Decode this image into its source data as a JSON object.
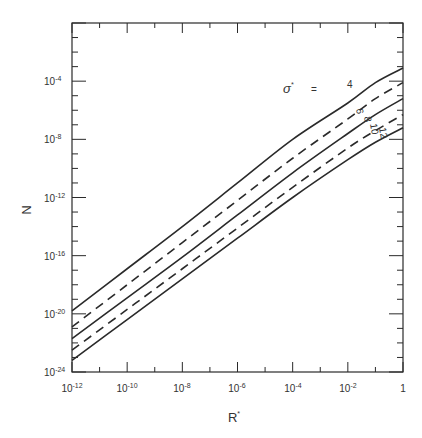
{
  "chart_data": {
    "type": "line",
    "title": "",
    "xlabel": "R*",
    "ylabel": "N",
    "xscale": "log",
    "yscale": "log",
    "xlim": [
      1e-12,
      1
    ],
    "ylim": [
      1e-24,
      1
    ],
    "grid": false,
    "legend_position": "inline labels near right end",
    "legend_title": "σ* =",
    "x_ticks": [
      "10^-12",
      "10^-10",
      "10^-8",
      "10^-6",
      "10^-4",
      "10^-2",
      "1"
    ],
    "y_ticks": [
      "10^-24",
      "10^-20",
      "10^-16",
      "10^-12",
      "10^-8",
      "10^-4"
    ],
    "x_log10": [
      -12,
      -10,
      -8,
      -6,
      -4,
      -2,
      -1,
      0
    ],
    "series": [
      {
        "name": "σ* = 4",
        "style": "solid",
        "log10_y": [
          -19.8,
          -16.9,
          -14.0,
          -11.0,
          -8.0,
          -5.5,
          -4.1,
          -3.1
        ]
      },
      {
        "name": "σ* = 6",
        "style": "dashed",
        "log10_y": [
          -20.9,
          -18.0,
          -15.1,
          -12.2,
          -9.3,
          -6.6,
          -5.2,
          -4.1
        ]
      },
      {
        "name": "σ* = 8",
        "style": "solid",
        "log10_y": [
          -21.7,
          -18.9,
          -16.1,
          -13.2,
          -10.3,
          -7.6,
          -6.3,
          -5.2
        ]
      },
      {
        "name": "σ* = 10",
        "style": "dashed",
        "log10_y": [
          -22.5,
          -19.7,
          -16.9,
          -14.1,
          -11.3,
          -8.6,
          -7.4,
          -6.3
        ]
      },
      {
        "name": "σ* = 12",
        "style": "solid",
        "log10_y": [
          -23.2,
          -20.4,
          -17.6,
          -14.8,
          -12.0,
          -9.4,
          -8.2,
          -7.2
        ]
      }
    ]
  },
  "labels": {
    "xlabel": "R",
    "xlabel_sup": "*",
    "ylabel": "N",
    "legend_sigma": "σ",
    "legend_sup": "*",
    "legend_eq": "=",
    "curve_labels": [
      "4",
      "6",
      "8",
      "10",
      "12"
    ],
    "x_tick_base": [
      "10",
      "10",
      "10",
      "10",
      "10",
      "10",
      "1"
    ],
    "x_tick_exp": [
      "-12",
      "-10",
      "-8",
      "-6",
      "-4",
      "-2",
      ""
    ],
    "y_tick_base": [
      "10",
      "10",
      "10",
      "10",
      "10",
      "10"
    ],
    "y_tick_exp": [
      "-24",
      "-20",
      "-16",
      "-12",
      "-8",
      "-4"
    ]
  }
}
